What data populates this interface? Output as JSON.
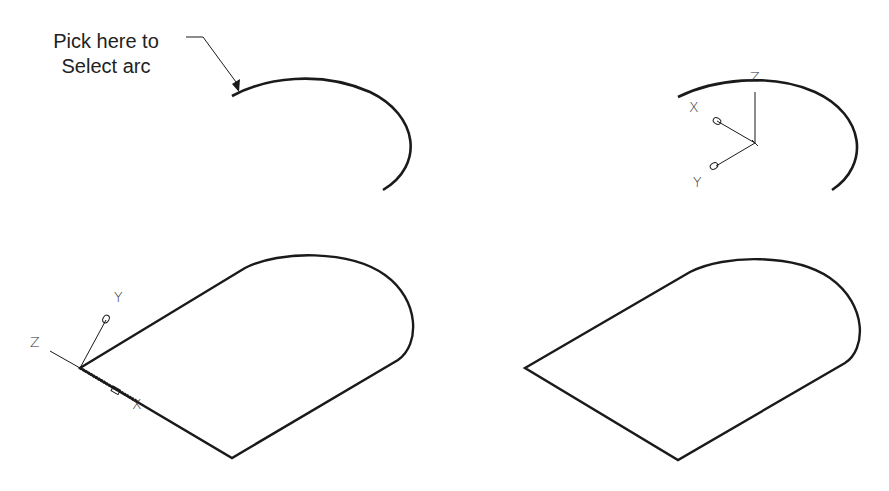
{
  "annotation": {
    "line1": "Pick here to",
    "line2": "Select arc"
  },
  "panels": [
    {
      "id": "step1",
      "description": "Isolated arc with selection pointer"
    },
    {
      "id": "step2",
      "description": "Arc with UCS icon at center",
      "axes": {
        "x": "X",
        "y": "Y",
        "z": "Z"
      }
    },
    {
      "id": "step3",
      "description": "Closed profile with UCS icon at corner",
      "axes": {
        "x": "X",
        "y": "Y",
        "z": "Z"
      }
    },
    {
      "id": "step4",
      "description": "Closed profile without UCS icon"
    }
  ],
  "colors": {
    "stroke": "#1a1a1a",
    "background": "#ffffff"
  }
}
